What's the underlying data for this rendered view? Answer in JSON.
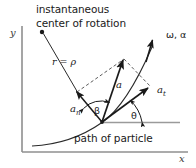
{
  "figure": {
    "title_lines": [
      "instantaneous",
      "center of rotation"
    ],
    "caption": "path of particle",
    "axes": {
      "y_label": "y",
      "x_label": "x"
    },
    "labels": {
      "radius": "r = ρ",
      "angular": "ω, α",
      "accel_total": "a",
      "accel_normal_base": "a",
      "accel_normal_sub": "n",
      "accel_tangential_base": "a",
      "accel_tangential_sub": "t",
      "angle_beta": "β",
      "angle_theta": "θ"
    },
    "colors": {
      "ink": "#1a1a1a",
      "axis": "#8a8a8a",
      "background": "#ffffff"
    },
    "geometry": {
      "particle_point": [
        102,
        122
      ],
      "rotation_center_point": [
        42,
        32
      ],
      "note": "vectors originate at the particle on the curved path"
    }
  }
}
